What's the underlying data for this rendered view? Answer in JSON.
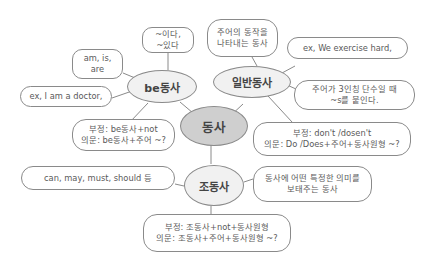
{
  "center": {
    "label": "동사"
  },
  "branches": {
    "be": {
      "label": "be동사",
      "boxes": {
        "meaning": "~이다,\n~있다",
        "forms": "am, is,\nare",
        "example": "ex, I am a doctor,",
        "rules": "부정: be동사+not\n의문: be동사+주어 ~?"
      }
    },
    "general": {
      "label": "일반동사",
      "boxes": {
        "meaning": "주어의 동작을\n나타내는 동사",
        "example": "ex, We exercise hard,",
        "third_person": "주어가 3인칭 단수일 때\n~s를 붙인다.",
        "rules": "부정: don't /dosen't\n의문: Do /Does+주어+동사원형 ~?"
      }
    },
    "auxiliary": {
      "label": "조동사",
      "boxes": {
        "forms": "can, may, must, should 등",
        "meaning": "동사에 어떤 특정한 의미를\n보태주는 동사",
        "rules": "부정: 조동사+not+동사원형\n의문: 조동사+주어+동사원형 ~?"
      }
    }
  }
}
